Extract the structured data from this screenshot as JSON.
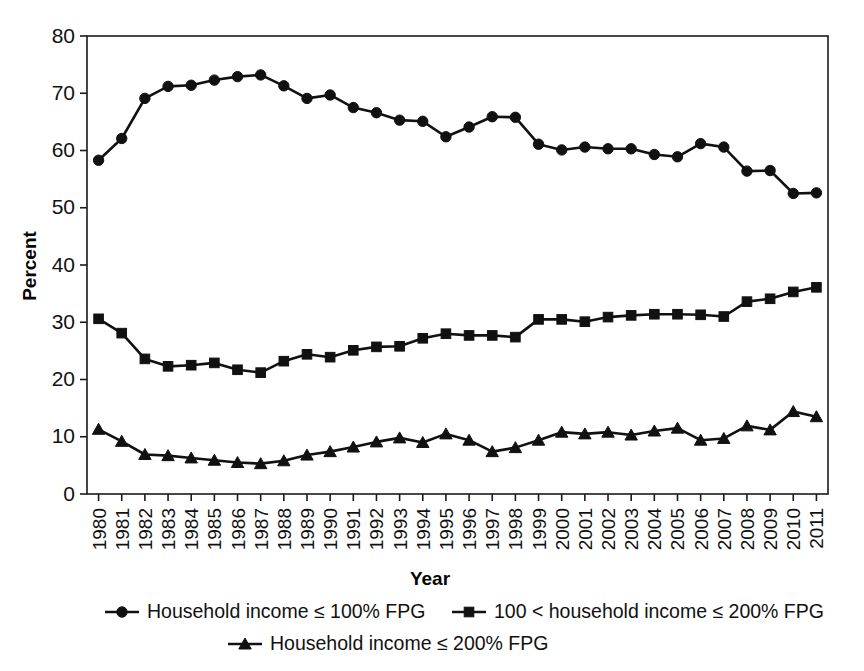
{
  "chart_data": {
    "type": "line",
    "title": "",
    "xlabel": "Year",
    "ylabel": "Percent",
    "ylim": [
      0,
      80
    ],
    "ytick_labels": [
      "0",
      "10",
      "20",
      "30",
      "40",
      "50",
      "60",
      "70",
      "80"
    ],
    "yticks": [
      0,
      10,
      20,
      30,
      40,
      50,
      60,
      70,
      80
    ],
    "grid": false,
    "legend_position": "bottom",
    "categories": [
      "1980",
      "1981",
      "1982",
      "1983",
      "1984",
      "1985",
      "1986",
      "1987",
      "1988",
      "1989",
      "1990",
      "1991",
      "1992",
      "1993",
      "1994",
      "1995",
      "1996",
      "1997",
      "1998",
      "1999",
      "2000",
      "2001",
      "2002",
      "2003",
      "2004",
      "2005",
      "2006",
      "2007",
      "2008",
      "2009",
      "2010",
      "2011"
    ],
    "series": [
      {
        "name": "Household income ≤ 100% FPG",
        "marker": "circle",
        "values": [
          58.3,
          62.1,
          69.1,
          71.2,
          71.4,
          72.3,
          72.9,
          73.2,
          71.3,
          69.1,
          69.7,
          67.5,
          66.6,
          65.3,
          65.1,
          62.4,
          64.1,
          65.9,
          65.8,
          61.1,
          60.1,
          60.6,
          60.3,
          60.3,
          59.3,
          58.9,
          61.2,
          60.6,
          56.4,
          56.5,
          52.5,
          52.6
        ]
      },
      {
        "name": "100 < household income ≤ 200% FPG",
        "marker": "square",
        "values": [
          30.6,
          28.1,
          23.6,
          22.3,
          22.5,
          22.9,
          21.7,
          21.2,
          23.2,
          24.4,
          23.9,
          25.1,
          25.7,
          25.8,
          27.2,
          28.0,
          27.7,
          27.7,
          27.4,
          30.5,
          30.5,
          30.1,
          30.9,
          31.2,
          31.4,
          31.4,
          31.3,
          31.0,
          33.6,
          34.1,
          35.3,
          36.1
        ]
      },
      {
        "name": "Household income ≤ 200% FPG",
        "marker": "triangle",
        "values": [
          11.3,
          9.2,
          6.9,
          6.7,
          6.3,
          5.9,
          5.5,
          5.3,
          5.8,
          6.8,
          7.4,
          8.2,
          9.1,
          9.8,
          9.0,
          10.5,
          9.4,
          7.4,
          8.1,
          9.4,
          10.8,
          10.5,
          10.8,
          10.3,
          11.0,
          11.5,
          9.4,
          9.7,
          11.9,
          11.2,
          14.4,
          13.5
        ]
      }
    ],
    "legend": [
      {
        "label": "Household income ≤ 100% FPG",
        "marker": "circle"
      },
      {
        "label": "100 < household income ≤ 200% FPG",
        "marker": "square"
      },
      {
        "label": "Household income ≤ 200% FPG",
        "marker": "triangle"
      }
    ],
    "colors": {
      "line": "#111111",
      "marker": "#111111",
      "axis": "#1a1a1a",
      "background": "#ffffff"
    }
  }
}
